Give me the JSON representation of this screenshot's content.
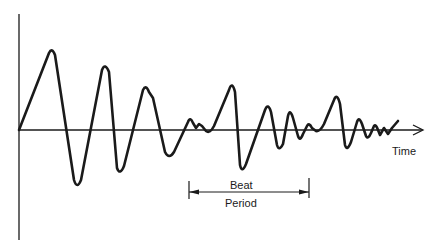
{
  "diagram": {
    "type": "waveform",
    "axes": {
      "x_label": "Time",
      "y_label": ""
    },
    "annotation": {
      "line1": "Beat",
      "line2": "Period"
    },
    "colors": {
      "stroke": "#1a1a1a",
      "background": "#ffffff"
    }
  }
}
